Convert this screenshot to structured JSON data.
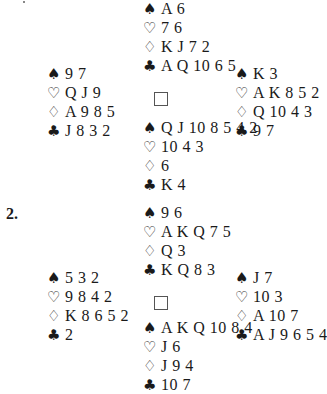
{
  "suit_symbols": {
    "spades": "♠",
    "hearts": "♡",
    "diamonds": "♢",
    "clubs": "♣"
  },
  "deals": [
    {
      "label": "",
      "north": {
        "spades": "A 6",
        "hearts": "7 6",
        "diamonds": "K J 7 2",
        "clubs": "A Q 10 6 5"
      },
      "west": {
        "spades": "9 7",
        "hearts": "Q J 9",
        "diamonds": "A 9 8 5",
        "clubs": "J 8 3 2"
      },
      "east": {
        "spades": "K 3",
        "hearts": "A K 8 5 2",
        "diamonds": "Q 10 4 3",
        "clubs": "9 7"
      },
      "south": {
        "spades": "Q J 10 8 5 4 2",
        "hearts": "10 4 3",
        "diamonds": "6",
        "clubs": "K 4"
      }
    },
    {
      "label": "2.",
      "north": {
        "spades": "9 6",
        "hearts": "A K Q 7 5",
        "diamonds": "Q 3",
        "clubs": "K Q 8 3"
      },
      "west": {
        "spades": "5 3 2",
        "hearts": "9 8 4 2",
        "diamonds": "K 8 6 5 2",
        "clubs": "2"
      },
      "east": {
        "spades": "J 7",
        "hearts": "10 3",
        "diamonds": "A 10 7",
        "clubs": "A J 9 6 5 4"
      },
      "south": {
        "spades": "A K Q 10 8 4",
        "hearts": "J 6",
        "diamonds": "J 9 4",
        "clubs": "10 7"
      }
    }
  ]
}
